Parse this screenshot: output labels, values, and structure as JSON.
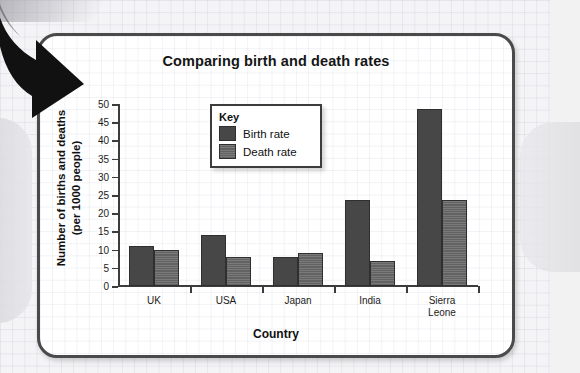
{
  "page": {
    "background_color": "#f4f4f6",
    "card_border_color": "#4a4a4a",
    "cropped_top_text": "",
    "annotation": "down-right-arrow"
  },
  "chart_data": {
    "type": "bar",
    "title": "Comparing birth and death rates",
    "xlabel": "Country",
    "ylabel": "Number of births and deaths\n(per 1000 people)",
    "ylabel_line1": "Number of births and deaths",
    "ylabel_line2": "(per 1000 people)",
    "categories": [
      "UK",
      "USA",
      "Japan",
      "India",
      "Sierra\nLeone"
    ],
    "category_labels_plain": [
      "UK",
      "USA",
      "Japan",
      "India",
      "Sierra Leone"
    ],
    "series": [
      {
        "name": "Birth rate",
        "color": "#474747",
        "values": [
          11,
          14,
          8,
          23.5,
          48.5
        ]
      },
      {
        "name": "Death rate",
        "color": "#6b6b6b",
        "values": [
          10,
          8,
          9,
          7,
          23.5
        ]
      }
    ],
    "ylim": [
      0,
      50
    ],
    "yticks": [
      0,
      5,
      10,
      15,
      20,
      25,
      30,
      35,
      40,
      45,
      50
    ],
    "ytick_labels": [
      "0",
      "5",
      "10",
      "15",
      "20",
      "25",
      "30",
      "35",
      "40",
      "45",
      "50"
    ],
    "grid": true,
    "legend_position": "upper-center-left",
    "legend": {
      "title": "Key",
      "entries": [
        "Birth rate",
        "Death rate"
      ]
    }
  }
}
